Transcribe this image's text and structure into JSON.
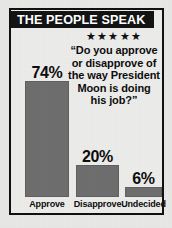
{
  "header": {
    "title": "THE PEOPLE SPEAK"
  },
  "rating": {
    "stars_icon": "star-icon",
    "stars": "★★★★★",
    "count": 5
  },
  "quote": {
    "lines": [
      "“Do you approve",
      "or disapprove of",
      "the way President",
      "Moon is doing",
      "his job?”"
    ],
    "full_text": "“Do you approve or disapprove of the way President Moon is doing his job?”"
  },
  "colors": {
    "bar": "#6e6e6e",
    "ink": "#111111",
    "paper": "#ececeb",
    "header_bg": "#131313",
    "header_fg": "#ffffff"
  },
  "chart_data": {
    "type": "bar",
    "title": "THE PEOPLE SPEAK",
    "xlabel": "",
    "ylabel": "",
    "ylim": [
      0,
      100
    ],
    "grid": false,
    "legend": "none",
    "categories": [
      "Approve",
      "Disapprove",
      "Undecided"
    ],
    "values": [
      74,
      20,
      6
    ],
    "value_labels": [
      "74%",
      "20%",
      "6%"
    ],
    "bars": [
      {
        "label": "Approve",
        "value": 74,
        "value_label": "74%",
        "bar_px": 116
      },
      {
        "label": "Disapprove",
        "value": 20,
        "value_label": "20%",
        "bar_px": 32
      },
      {
        "label": "Undecided",
        "value": 6,
        "value_label": "6%",
        "bar_px": 10
      }
    ]
  }
}
